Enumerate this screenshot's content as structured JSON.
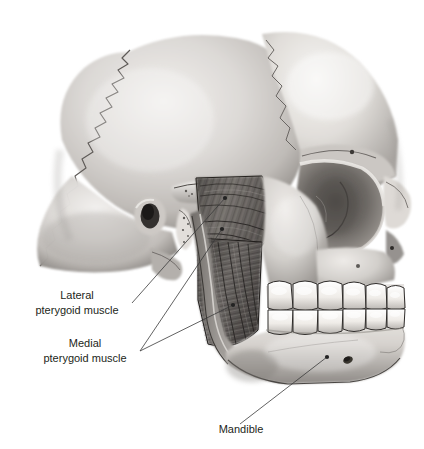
{
  "figure": {
    "background_color": "#ffffff",
    "line_color": "#3a3a3a",
    "text_color": "#231f20",
    "style": "grayscale medical illustration, airbrush shading"
  },
  "labels": [
    {
      "id": "lateral-pterygoid",
      "line1": "Lateral",
      "line2": "pterygoid muscle",
      "text_x": 77,
      "line1_y": 299,
      "line2_y": 314,
      "leaders": [
        {
          "from_x": 132,
          "from_y": 303,
          "to_x": 225,
          "to_y": 198
        }
      ]
    },
    {
      "id": "medial-pterygoid",
      "line1": "Medial",
      "line2": "pterygoid muscle",
      "text_x": 85,
      "line1_y": 347,
      "line2_y": 362,
      "leaders": [
        {
          "from_x": 140,
          "from_y": 351,
          "to_x": 222,
          "to_y": 229
        },
        {
          "from_x": 140,
          "from_y": 351,
          "to_x": 233,
          "to_y": 305
        }
      ]
    },
    {
      "id": "mandible",
      "line1": "Mandible",
      "line2": "",
      "text_x": 241,
      "line1_y": 433,
      "line2_y": 0,
      "leaders": [
        {
          "from_x": 240,
          "from_y": 424,
          "to_x": 327,
          "to_y": 357
        }
      ]
    }
  ],
  "anatomy_parts": [
    {
      "name": "parietal-bone",
      "label": "Parietal bone (cut)"
    },
    {
      "name": "frontal-bone",
      "label": "Frontal bone"
    },
    {
      "name": "orbit",
      "label": "Orbit / eye socket"
    },
    {
      "name": "nasal-bone",
      "label": "Nasal bone"
    },
    {
      "name": "zygomatic-arch-stump",
      "label": "Cut zygomatic arch"
    },
    {
      "name": "external-acoustic-meatus",
      "label": "External acoustic meatus"
    },
    {
      "name": "styloid-process",
      "label": "Styloid process"
    },
    {
      "name": "mastoid-process",
      "label": "Mastoid process"
    },
    {
      "name": "lateral-pterygoid-muscle",
      "label": "Lateral pterygoid muscle"
    },
    {
      "name": "medial-pterygoid-muscle",
      "label": "Medial pterygoid muscle"
    },
    {
      "name": "mandible-ramus",
      "label": "Ramus of mandible"
    },
    {
      "name": "mandible-body",
      "label": "Body of mandible"
    },
    {
      "name": "maxillary-teeth",
      "label": "Upper (maxillary) teeth"
    },
    {
      "name": "mandibular-teeth",
      "label": "Lower (mandibular) teeth"
    },
    {
      "name": "mental-foramen",
      "label": "Mental foramen"
    }
  ]
}
